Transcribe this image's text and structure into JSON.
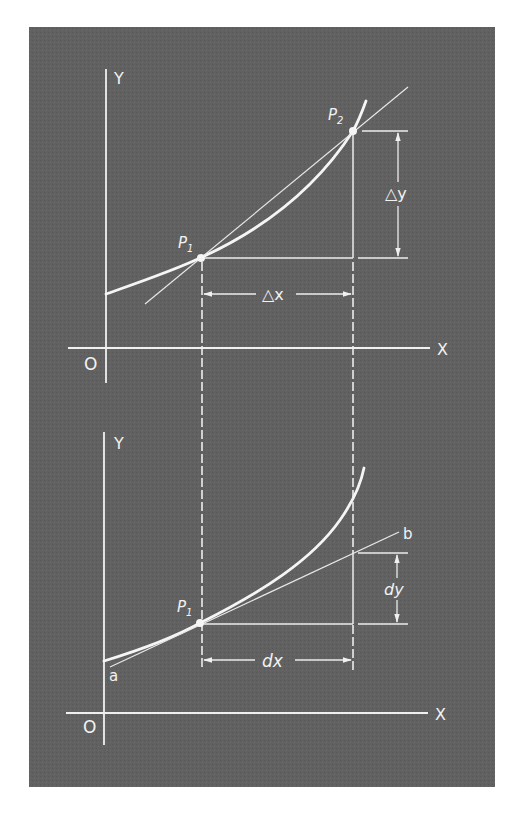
{
  "figure": {
    "background": "#ffffff",
    "panel_color": "#606060",
    "line_color": "#f0f0f0",
    "top_diagram": {
      "axis_y_label": "Y",
      "axis_x_label": "X",
      "origin_label": "O",
      "point1_label": "P",
      "point1_subscript": "1",
      "point2_label": "P",
      "point2_subscript": "2",
      "delta_y_label": "△y",
      "delta_x_label": "△x",
      "line_type": "secant"
    },
    "bottom_diagram": {
      "axis_y_label": "Y",
      "axis_x_label": "X",
      "origin_label": "O",
      "point1_label": "P",
      "point1_subscript": "1",
      "tangent_start_label": "a",
      "tangent_end_label": "b",
      "dy_label": "dy",
      "dx_label": "dx",
      "line_type": "tangent"
    }
  }
}
